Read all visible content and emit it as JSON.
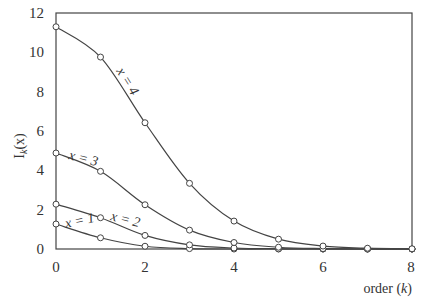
{
  "chart_data": {
    "type": "line",
    "title": "",
    "xlabel": "order (k)",
    "ylabel": "I_k(x)",
    "xlim": [
      0,
      8
    ],
    "ylim": [
      0,
      12
    ],
    "xticks": [
      0,
      2,
      4,
      6,
      8
    ],
    "yticks": [
      0,
      2,
      4,
      6,
      8,
      10,
      12
    ],
    "grid": false,
    "legend": "inline labels on curves",
    "x": [
      0,
      1,
      2,
      3,
      4,
      5,
      6,
      7,
      8
    ],
    "series": [
      {
        "name": "x = 1",
        "values": [
          1.27,
          0.57,
          0.14,
          0.02,
          0.0,
          0.0,
          0.0,
          0.0,
          0.0
        ]
      },
      {
        "name": "x = 2",
        "values": [
          2.28,
          1.59,
          0.69,
          0.21,
          0.05,
          0.01,
          0.0,
          0.0,
          0.0
        ]
      },
      {
        "name": "x = 3",
        "values": [
          4.88,
          3.95,
          2.25,
          0.96,
          0.33,
          0.09,
          0.02,
          0.0,
          0.0
        ]
      },
      {
        "name": "x = 4",
        "values": [
          11.3,
          9.76,
          6.42,
          3.34,
          1.42,
          0.5,
          0.15,
          0.04,
          0.01
        ]
      }
    ]
  },
  "labels": {
    "xlabel_text": "order (",
    "xlabel_var": "k",
    "xlabel_close": ")",
    "ylabel_main": "I",
    "ylabel_sub": "k",
    "ylabel_arg": "(x)",
    "curve_x1": "x = 1",
    "curve_x2": "x = 2",
    "curve_x3": "x = 3",
    "curve_x4": "x = 4"
  },
  "ticks": {
    "x": [
      "0",
      "2",
      "4",
      "6",
      "8"
    ],
    "y": [
      "0",
      "2",
      "4",
      "6",
      "8",
      "10",
      "12"
    ]
  }
}
